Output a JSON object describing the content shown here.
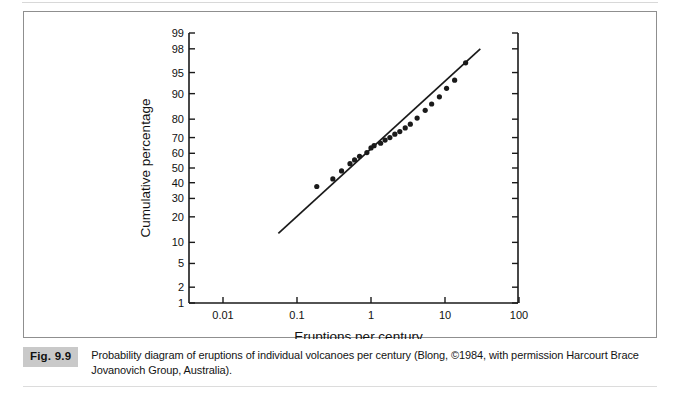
{
  "figure": {
    "number_label": "Fig. 9.9",
    "caption": "Probability diagram of eruptions of individual volcanoes per century (Blong, ©1984, with permission Harcourt Brace Jovanovich Group, Australia)."
  },
  "chart_data": {
    "type": "scatter",
    "title": "",
    "xlabel": "Eruptions per century",
    "ylabel": "Cumulative percentage",
    "x_scale": "log10",
    "y_scale": "probability",
    "xlim": [
      0.0025,
      316.0
    ],
    "ylim": [
      1,
      99
    ],
    "grid": false,
    "legend": null,
    "x_ticks": [
      {
        "value": 0.01,
        "label": "0.01"
      },
      {
        "value": 0.1,
        "label": "0.1"
      },
      {
        "value": 1,
        "label": "1"
      },
      {
        "value": 10,
        "label": "10"
      },
      {
        "value": 100,
        "label": "100"
      }
    ],
    "y_ticks": [
      {
        "value": 1,
        "label": "1"
      },
      {
        "value": 2,
        "label": "2"
      },
      {
        "value": 5,
        "label": "5"
      },
      {
        "value": 10,
        "label": "10"
      },
      {
        "value": 20,
        "label": "20"
      },
      {
        "value": 30,
        "label": "30"
      },
      {
        "value": 40,
        "label": "40"
      },
      {
        "value": 50,
        "label": "50"
      },
      {
        "value": 60,
        "label": "60"
      },
      {
        "value": 70,
        "label": "70"
      },
      {
        "value": 80,
        "label": "80"
      },
      {
        "value": 90,
        "label": "90"
      },
      {
        "value": 95,
        "label": "95"
      },
      {
        "value": 98,
        "label": "98"
      },
      {
        "value": 99,
        "label": "99"
      }
    ],
    "right_axis_ticks_unlabeled": [
      1,
      2,
      5,
      10,
      20,
      30,
      40,
      50,
      60,
      70,
      80,
      90,
      95,
      98,
      99
    ],
    "points": [
      {
        "x": 0.185,
        "y": 37.5
      },
      {
        "x": 0.305,
        "y": 42.5
      },
      {
        "x": 0.4,
        "y": 48.0
      },
      {
        "x": 0.52,
        "y": 53.0
      },
      {
        "x": 0.6,
        "y": 55.5
      },
      {
        "x": 0.7,
        "y": 58.0
      },
      {
        "x": 0.88,
        "y": 60.5
      },
      {
        "x": 1.0,
        "y": 63.5
      },
      {
        "x": 1.1,
        "y": 65.0
      },
      {
        "x": 1.35,
        "y": 66.5
      },
      {
        "x": 1.55,
        "y": 68.5
      },
      {
        "x": 1.8,
        "y": 70.0
      },
      {
        "x": 2.1,
        "y": 72.0
      },
      {
        "x": 2.45,
        "y": 73.5
      },
      {
        "x": 2.9,
        "y": 75.5
      },
      {
        "x": 3.4,
        "y": 77.5
      },
      {
        "x": 4.2,
        "y": 80.5
      },
      {
        "x": 5.4,
        "y": 84.0
      },
      {
        "x": 6.6,
        "y": 86.5
      },
      {
        "x": 8.4,
        "y": 89.0
      },
      {
        "x": 10.5,
        "y": 91.5
      },
      {
        "x": 13.5,
        "y": 93.5
      },
      {
        "x": 19.0,
        "y": 96.5
      }
    ],
    "fit_line": {
      "x_start": 0.056,
      "y_start": 13.0,
      "x_end": 30.0,
      "y_end": 98.0,
      "style": "solid"
    }
  }
}
